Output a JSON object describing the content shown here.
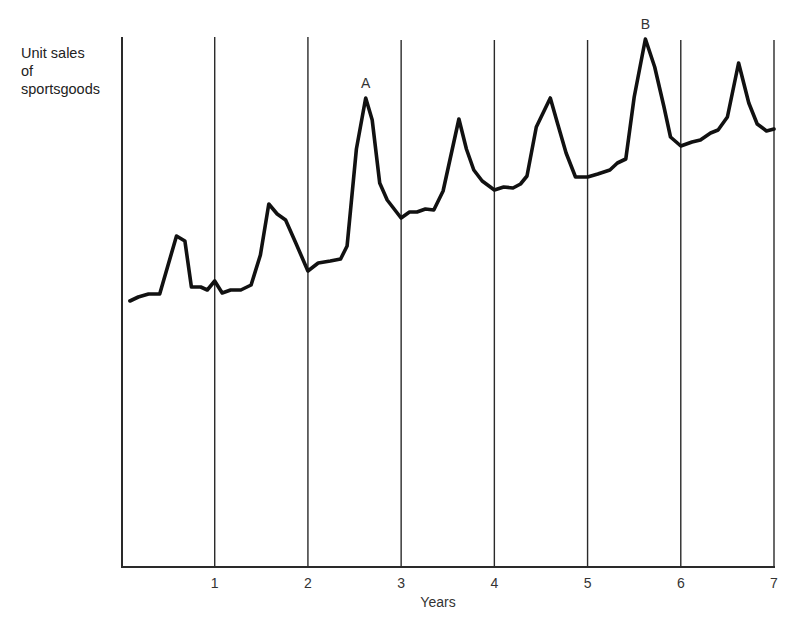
{
  "chart_data": {
    "type": "line",
    "title": "",
    "xlabel": "Years",
    "ylabel": "Unit sales\nof\nsportsgoods",
    "xlim": [
      0,
      7
    ],
    "ylim": [
      0,
      530
    ],
    "x_ticks": [
      "1",
      "2",
      "3",
      "4",
      "5",
      "6",
      "7"
    ],
    "y_ticks": [],
    "grid": {
      "vertical_lines_at_years": true,
      "horizontal": false
    },
    "legend": null,
    "annotations": [
      {
        "label": "A",
        "x": 2.62,
        "y": 469
      },
      {
        "label": "B",
        "x": 5.62,
        "y": 528
      }
    ],
    "series": [
      {
        "name": "Unit sales of sportsgoods",
        "x": [
          0.09,
          0.18,
          0.29,
          0.41,
          0.5,
          0.59,
          0.68,
          0.75,
          0.85,
          0.92,
          1.0,
          1.08,
          1.17,
          1.28,
          1.39,
          1.49,
          1.58,
          1.67,
          1.76,
          1.87,
          2.0,
          2.11,
          2.24,
          2.35,
          2.42,
          2.52,
          2.62,
          2.69,
          2.77,
          2.85,
          3.0,
          3.09,
          3.17,
          3.26,
          3.35,
          3.45,
          3.62,
          3.7,
          3.78,
          3.87,
          4.0,
          4.1,
          4.2,
          4.28,
          4.35,
          4.45,
          4.6,
          4.68,
          4.77,
          4.87,
          5.0,
          5.11,
          5.24,
          5.32,
          5.41,
          5.5,
          5.62,
          5.72,
          5.82,
          5.89,
          6.0,
          6.12,
          6.21,
          6.32,
          6.4,
          6.5,
          6.62,
          6.73,
          6.82,
          6.92,
          7.0
        ],
        "values": [
          266,
          270,
          273,
          273,
          302,
          331,
          326,
          280,
          280,
          277,
          286,
          274,
          277,
          277,
          282,
          312,
          363,
          353,
          347,
          324,
          296,
          304,
          306,
          308,
          321,
          418,
          469,
          447,
          384,
          367,
          349,
          355,
          355,
          358,
          357,
          376,
          448,
          418,
          397,
          386,
          377,
          380,
          379,
          383,
          391,
          440,
          469,
          443,
          414,
          390,
          390,
          393,
          397,
          404,
          408,
          470,
          528,
          500,
          460,
          430,
          421,
          425,
          427,
          434,
          437,
          450,
          504,
          464,
          443,
          436,
          438
        ]
      }
    ]
  }
}
